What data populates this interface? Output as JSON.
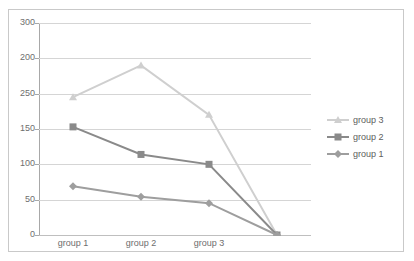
{
  "chart_data": {
    "type": "line",
    "title": "",
    "xlabel": "",
    "ylabel": "",
    "categories": [
      "group 1",
      "group 2",
      "group 3",
      ""
    ],
    "x_tick_labels": [
      "group 1",
      "group 2",
      "group 3"
    ],
    "y_tick_labels": [
      "300",
      "200",
      "250",
      "150",
      "100",
      "50",
      "0"
    ],
    "y_axis_note": "tick labels printed top-to-bottom in the order 300, 200, 250, 150, 100, 50, 0 at evenly spaced gridlines",
    "grid": true,
    "legend_position": "right",
    "series": [
      {
        "name": "group 3",
        "color": "#cfcfcf",
        "marker": "triangle",
        "values": [
          195,
          240,
          170,
          0
        ]
      },
      {
        "name": "group 2",
        "color": "#8a8a8a",
        "marker": "square",
        "values": [
          153,
          114,
          100,
          0
        ]
      },
      {
        "name": "group 1",
        "color": "#9e9e9e",
        "marker": "diamond",
        "values": [
          69,
          54,
          45,
          0
        ]
      }
    ]
  },
  "legend": {
    "items": [
      {
        "label": "group 3"
      },
      {
        "label": "group 2"
      },
      {
        "label": "group 1"
      }
    ]
  },
  "colors": {
    "series_3": "#cfcfcf",
    "series_2": "#8a8a8a",
    "series_1": "#9e9e9e",
    "gridline": "#d5d5d5",
    "axis": "#a8a8a8",
    "border": "#c9c9c9",
    "tick_text": "#6e6e6e",
    "legend_text": "#5d5d5d",
    "background": "#ffffff"
  }
}
